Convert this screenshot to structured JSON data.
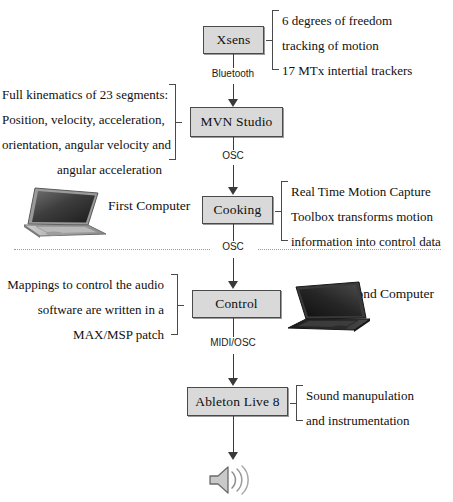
{
  "diagram": {
    "nodes": [
      {
        "id": "xsens",
        "label": "Xsens"
      },
      {
        "id": "mvn",
        "label": "MVN Studio"
      },
      {
        "id": "cooking",
        "label": "Cooking"
      },
      {
        "id": "control",
        "label": "Control"
      },
      {
        "id": "ableton",
        "label": "Ableton Live 8"
      }
    ],
    "edge_labels": [
      {
        "id": "bluetooth",
        "label": "Bluetooth"
      },
      {
        "id": "osc-1",
        "label": "OSC"
      },
      {
        "id": "osc-2",
        "label": "OSC"
      },
      {
        "id": "midi-osc",
        "label": "MIDI/OSC"
      }
    ],
    "annotations": {
      "xsens": [
        "6 degrees of freedom",
        "tracking of motion",
        "17 MTx intertial trackers"
      ],
      "mvn": [
        "Full kinematics of 23 segments:",
        "Position, velocity, acceleration,",
        "orientation, angular velocity and",
        "angular acceleration"
      ],
      "cooking": [
        "Real Time Motion Capture",
        "Toolbox transforms motion",
        "information into control data"
      ],
      "control": [
        "Mappings to control the audio",
        "software are written in a",
        "MAX/MSP patch"
      ],
      "ableton": [
        "Sound manupulation",
        "and instrumentation"
      ]
    },
    "captions": [
      {
        "id": "first-computer",
        "label": "First Computer"
      },
      {
        "id": "second-computer",
        "label": "Second Computer"
      }
    ],
    "icons": [
      {
        "id": "laptop-first",
        "name": "laptop-icon"
      },
      {
        "id": "laptop-second",
        "name": "laptop-icon"
      },
      {
        "id": "speaker",
        "name": "speaker-icon"
      }
    ],
    "colors": {
      "node_fill": "#d9d9d9",
      "node_border": "#4a4a4a",
      "connector": "#3a3a3a",
      "divider": "#9b9b9b",
      "text": "#101010"
    }
  }
}
